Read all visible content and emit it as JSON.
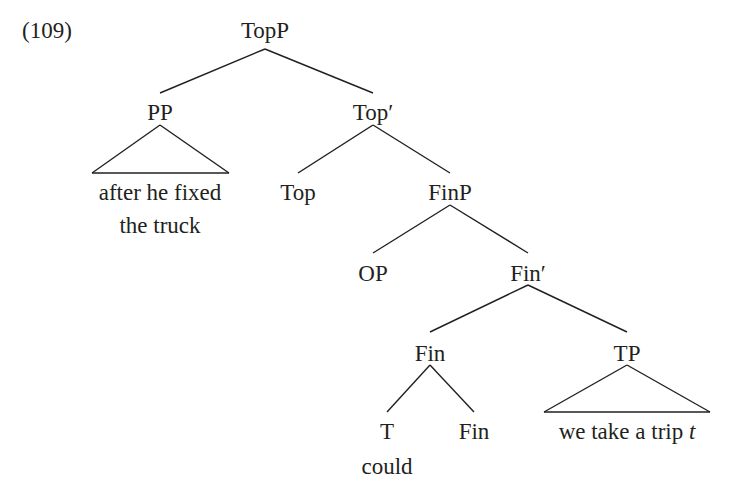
{
  "example": {
    "number": "(109)"
  },
  "tree": {
    "nodes": {
      "topp": "TopP",
      "pp": "PP",
      "top_bar": "Top′",
      "top": "Top",
      "finp": "FinP",
      "op": "OP",
      "fin_bar": "Fin′",
      "fin": "Fin",
      "tp": "TP",
      "t": "T",
      "fin_head": "Fin"
    },
    "terminals": {
      "pp_line1": "after he fixed",
      "pp_line2": "the truck",
      "t_word": "could",
      "tp_text": "we take a trip ",
      "tp_trace": "t"
    }
  }
}
